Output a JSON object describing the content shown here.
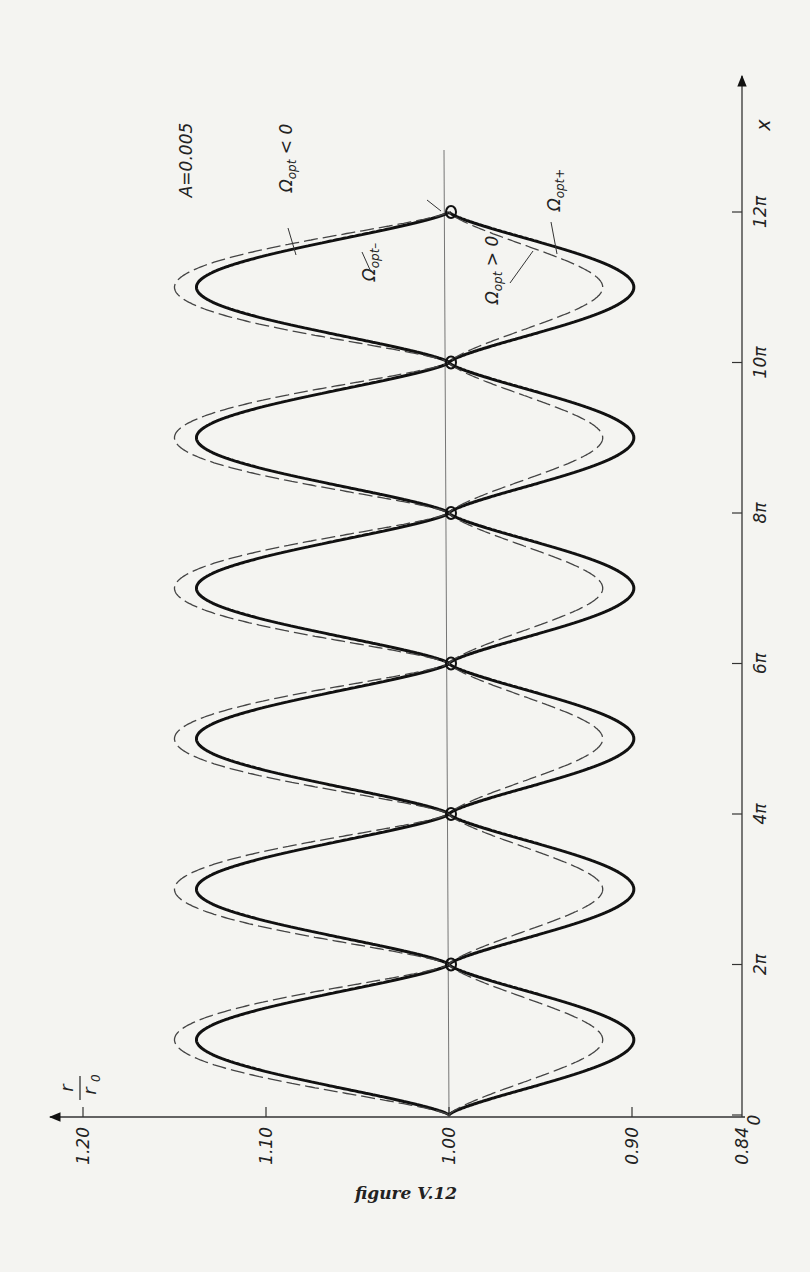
{
  "caption": "figure V.12",
  "annotations": {
    "parameter": "A=0.005",
    "omega_neg": "Ω",
    "omega_neg_sub": "opt",
    "omega_neg_rel": " < 0",
    "omega_minus_sub": "opt–",
    "omega_pos_rel": " > 0",
    "omega_plus_sub": "opt+"
  },
  "axes": {
    "x_label": "x",
    "y_label_num": "r",
    "y_label_den": "r",
    "y_label_den_sub": "0"
  },
  "chart_data": {
    "type": "line",
    "title": "",
    "orientation": "rotated 90° (x-axis vertical on right, r/r0 axis horizontal at bottom, increasing to the left)",
    "xlabel": "x",
    "ylabel": "r/r0",
    "x_ticks": [
      "0",
      "2π",
      "4π",
      "6π",
      "8π",
      "10π",
      "12π"
    ],
    "x_tick_values": [
      0,
      6.2832,
      12.5664,
      18.8496,
      25.1327,
      31.4159,
      37.6991
    ],
    "y_ticks": [
      "1.20",
      "1.10",
      "1.00",
      "0.90",
      "0.84"
    ],
    "y_tick_values": [
      1.2,
      1.1,
      1.0,
      0.9,
      0.84
    ],
    "xlim": [
      0,
      40.5
    ],
    "ylim": [
      0.84,
      1.2
    ],
    "parameter": {
      "A": 0.005
    },
    "period": "2π",
    "series": [
      {
        "name": "Ω_opt < 0 (Ω_opt−), exact",
        "style": "solid-thick",
        "branch": "upper",
        "x": [
          "0",
          "π",
          "2π",
          "3π",
          "4π",
          "5π",
          "6π",
          "7π",
          "8π",
          "9π",
          "10π",
          "11π",
          "12π"
        ],
        "values": [
          1.0,
          1.138,
          1.0,
          1.138,
          1.0,
          1.138,
          1.0,
          1.138,
          1.0,
          1.138,
          1.0,
          1.138,
          1.0
        ]
      },
      {
        "name": "Ω_opt < 0, approximation",
        "style": "dashed",
        "branch": "upper",
        "x": [
          "0",
          "π",
          "2π",
          "3π",
          "4π",
          "5π",
          "6π",
          "7π",
          "8π",
          "9π",
          "10π",
          "11π",
          "12π"
        ],
        "values": [
          1.0,
          1.15,
          1.0,
          1.15,
          1.0,
          1.15,
          1.0,
          1.15,
          1.0,
          1.15,
          1.0,
          1.15,
          1.0
        ]
      },
      {
        "name": "Ω_opt > 0 (Ω_opt+), exact",
        "style": "solid-thick",
        "branch": "lower",
        "x": [
          "0",
          "π",
          "2π",
          "3π",
          "4π",
          "5π",
          "6π",
          "7π",
          "8π",
          "9π",
          "10π",
          "11π",
          "12π"
        ],
        "values": [
          1.0,
          0.899,
          1.0,
          0.899,
          1.0,
          0.899,
          1.0,
          0.899,
          1.0,
          0.899,
          1.0,
          0.899,
          1.0
        ]
      },
      {
        "name": "Ω_opt > 0, approximation",
        "style": "dashed",
        "branch": "lower",
        "x": [
          "0",
          "π",
          "2π",
          "3π",
          "4π",
          "5π",
          "6π",
          "7π",
          "8π",
          "9π",
          "10π",
          "11π",
          "12π"
        ],
        "values": [
          1.0,
          0.916,
          1.0,
          0.916,
          1.0,
          0.916,
          1.0,
          0.916,
          1.0,
          0.916,
          1.0,
          0.916,
          1.0
        ]
      }
    ],
    "grid": false,
    "legend": "inline labels with leader lines"
  }
}
